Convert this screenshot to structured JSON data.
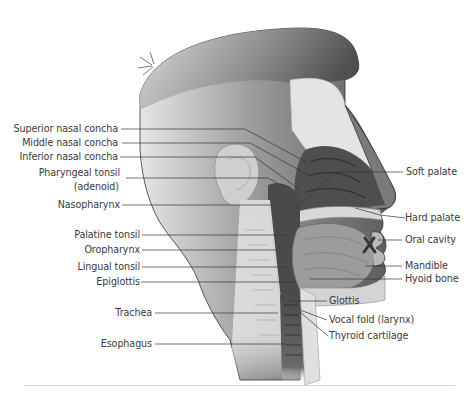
{
  "figure": {
    "left_labels": [
      {
        "id": "superior-nasal-concha",
        "text": "Superior nasal concha"
      },
      {
        "id": "middle-nasal-concha",
        "text": "Middle nasal concha"
      },
      {
        "id": "inferior-nasal-concha",
        "text": "Inferior nasal concha"
      },
      {
        "id": "pharyngeal-tonsil",
        "text": "Pharyngeal tonsil",
        "sub": "(adenoid)"
      },
      {
        "id": "nasopharynx",
        "text": "Nasopharynx"
      },
      {
        "id": "palatine-tonsil",
        "text": "Palatine tonsil"
      },
      {
        "id": "oropharynx",
        "text": "Oropharynx"
      },
      {
        "id": "lingual-tonsil",
        "text": "Lingual tonsil"
      },
      {
        "id": "epiglottis",
        "text": "Epiglottis"
      },
      {
        "id": "trachea",
        "text": "Trachea"
      },
      {
        "id": "esophagus",
        "text": "Esophagus"
      }
    ],
    "right_labels": [
      {
        "id": "soft-palate",
        "text": "Soft palate"
      },
      {
        "id": "hard-palate",
        "text": "Hard palate"
      },
      {
        "id": "oral-cavity",
        "text": "Oral cavity"
      },
      {
        "id": "mandible",
        "text": "Mandible"
      },
      {
        "id": "hyoid-bone",
        "text": "Hyoid bone"
      },
      {
        "id": "glottis",
        "text": "Glottis"
      },
      {
        "id": "vocal-fold",
        "text": "Vocal fold (larynx)"
      },
      {
        "id": "thyroid-cartilage",
        "text": "Thyroid cartilage"
      }
    ]
  }
}
